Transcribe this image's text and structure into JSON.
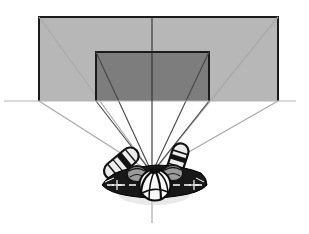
{
  "canvas": {
    "width": 309,
    "height": 234,
    "background": "#ffffff"
  },
  "diagram": {
    "type": "viewing-geometry-diagram",
    "screens": [
      {
        "name": "outer-screen",
        "x": 39,
        "y": 17,
        "width": 239,
        "height": 84,
        "fill": "#b7b7b7",
        "stroke": "#1b1b1b",
        "stroke_width": 2
      },
      {
        "name": "inner-screen",
        "x": 96,
        "y": 52,
        "width": 113,
        "height": 49,
        "fill": "#7d7d7d",
        "stroke": "#1b1b1b",
        "stroke_width": 2
      }
    ],
    "eye_point": {
      "x": 152,
      "y": 173
    },
    "sight_lines": [
      {
        "name": "outer-top-left",
        "x": 39,
        "y": 17,
        "group": "outer"
      },
      {
        "name": "outer-bottom-left",
        "x": 39,
        "y": 101,
        "group": "outer"
      },
      {
        "name": "outer-top-right",
        "x": 278,
        "y": 17,
        "group": "outer"
      },
      {
        "name": "outer-bottom-right",
        "x": 278,
        "y": 101,
        "group": "outer"
      },
      {
        "name": "inner-top-left",
        "x": 96,
        "y": 52,
        "group": "inner"
      },
      {
        "name": "inner-bottom-left",
        "x": 96,
        "y": 101,
        "group": "inner"
      },
      {
        "name": "inner-top-right",
        "x": 209,
        "y": 52,
        "group": "inner"
      },
      {
        "name": "inner-bottom-right",
        "x": 209,
        "y": 101,
        "group": "inner"
      }
    ],
    "line_styles": {
      "outer": {
        "color": "#a9a9a9",
        "width": 1.2
      },
      "inner": {
        "color": "#464646",
        "width": 1.1
      }
    },
    "horizon_line": {
      "x1": 4,
      "y1": 101,
      "x2": 296,
      "y2": 101,
      "color": "#b3b3b3",
      "width": 1
    },
    "center_line": {
      "x": 152,
      "segments": [
        {
          "y1": 17,
          "y2": 190,
          "color": "#2e2e2e",
          "width": 1.1
        },
        {
          "y1": 190,
          "y2": 223,
          "color": "#9a9a9a",
          "width": 1
        }
      ]
    },
    "figure": {
      "name": "seated-viewer-top-view"
    }
  }
}
